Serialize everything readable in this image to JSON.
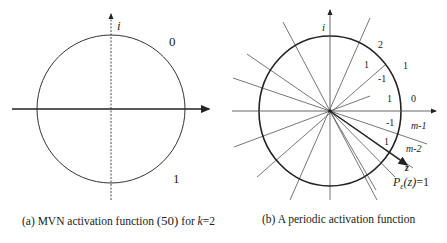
{
  "figure_a": {
    "caption": "(a) MVN activation function (50) for k=2",
    "caption_prefix": "(a) MVN activation function ",
    "caption_eq": "(50)",
    "caption_mid": " for ",
    "caption_var": "k",
    "caption_suffix": "=2",
    "axis_imag_label": "i",
    "sector_labels": [
      "0",
      "1"
    ]
  },
  "figure_b": {
    "caption": "(b) A periodic activation function",
    "axis_imag_label": "i",
    "sector_labels": {
      "outer": [
        "2",
        "1",
        "0",
        "m-1",
        "m-2"
      ],
      "inner": [
        "1",
        "-1",
        "1",
        "-1",
        "1"
      ]
    },
    "vector_label": "z",
    "function_label": "P_ε(z)=1",
    "function_lhs": "P",
    "function_sub": "ε",
    "function_arg": "(z)",
    "function_rhs": "=1"
  },
  "colors": {
    "stroke": "#222222",
    "thin_stroke": "#555555",
    "background": "#ffffff"
  }
}
